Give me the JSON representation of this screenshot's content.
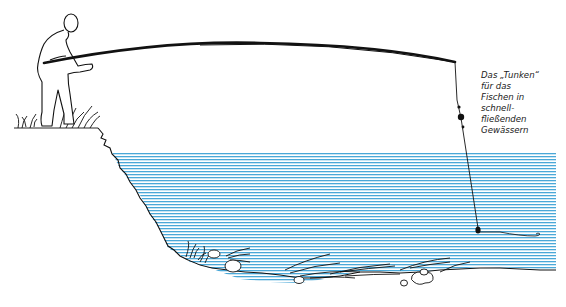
{
  "diagram": {
    "caption_lines": [
      "Das „Tunken“",
      "für das",
      "Fischen in",
      "schnell-",
      "fließenden",
      "Gewässern"
    ],
    "elements": [
      "angler",
      "fishing-rod",
      "fishing-line",
      "float",
      "sinker",
      "hook",
      "riverbank",
      "water",
      "riverbed-weeds",
      "stones"
    ],
    "colors": {
      "water_lines": "#4aa8d8",
      "ink": "#111111",
      "background": "#ffffff"
    },
    "water": {
      "top_y": 154,
      "bottom_y": 275,
      "line_spacing": 3
    }
  }
}
